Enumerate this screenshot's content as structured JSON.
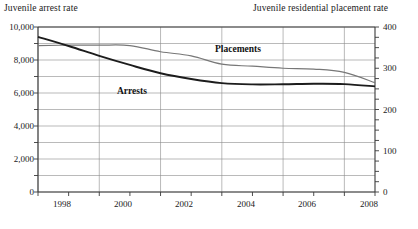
{
  "titles": {
    "left_axis": "Juvenile arrest rate",
    "right_axis": "Juvenile residential placement rate"
  },
  "series_labels": {
    "arrests": "Arrests",
    "placements": "Placements"
  },
  "left_axis_ticks": [
    "0",
    "2,000",
    "4,000",
    "6,000",
    "8,000",
    "10,000"
  ],
  "right_axis_ticks": [
    "0",
    "100",
    "200",
    "300",
    "400"
  ],
  "x_axis_ticks": [
    "1998",
    "2000",
    "2002",
    "2004",
    "2006",
    "2008"
  ],
  "colors": {
    "arrests_line": "#1c1c1c",
    "placements_line": "#777777",
    "gridline": "#8c8c8c",
    "axis": "#3a3a3a",
    "background": "#ffffff"
  },
  "chart_data": {
    "type": "line",
    "title": "",
    "xlabel": "",
    "ylabel": "Juvenile arrest rate",
    "y2label": "Juvenile residential placement rate",
    "grid": true,
    "legend": "inline-annotations",
    "x": [
      1997,
      1998,
      1999,
      2000,
      2001,
      2002,
      2003,
      2004,
      2005,
      2006,
      2007,
      2008
    ],
    "xlim": [
      1997,
      2008
    ],
    "ylim": [
      0,
      10000
    ],
    "y2lim": [
      0,
      400
    ],
    "xticks": [
      1998,
      2000,
      2002,
      2004,
      2006,
      2008
    ],
    "yticks": [
      0,
      2000,
      4000,
      6000,
      8000,
      10000
    ],
    "y2ticks": [
      0,
      100,
      200,
      300,
      400
    ],
    "series": [
      {
        "name": "Arrests",
        "axis": "left",
        "color": "#1c1c1c",
        "values": [
          9400,
          8850,
          8250,
          7700,
          7200,
          6850,
          6600,
          6520,
          6530,
          6560,
          6540,
          6400
        ]
      },
      {
        "name": "Placements",
        "axis": "right",
        "color": "#777777",
        "values": [
          355,
          356,
          356,
          355,
          340,
          330,
          310,
          305,
          300,
          298,
          290,
          265
        ]
      }
    ]
  }
}
